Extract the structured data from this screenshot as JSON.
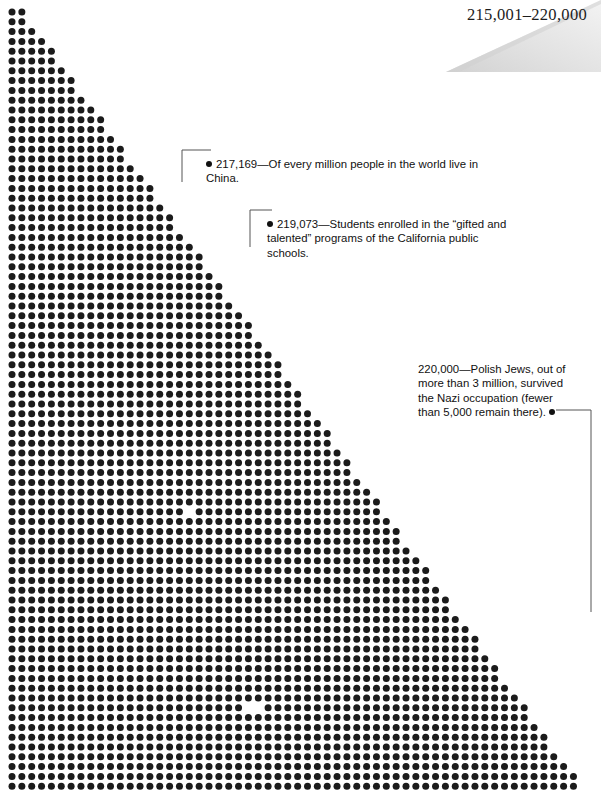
{
  "page": {
    "header_number": "215,001–220,000",
    "background_color": "#ffffff",
    "dot_color": "#1b1b1b",
    "fold_color": "#e4e4e4"
  },
  "grid": {
    "description": "right-triangle field of dots, apex top-left, filling lower-left of page",
    "dot_spacing_x": 9.85,
    "dot_spacing_y": 9.8,
    "dot_radius": 3.5,
    "origin_x": 12,
    "origin_y": 12,
    "columns": 60,
    "rows": 80,
    "hypotenuse_slope": 0.72,
    "gaps": [
      {
        "label": "gap-1",
        "x": 186,
        "y": 510
      },
      {
        "label": "gap-2",
        "x": 253,
        "y": 705
      }
    ]
  },
  "annotations": [
    {
      "id": "annotation-1",
      "value": "217,169",
      "text": "217,169—Of every million people in the world live in China.",
      "leader": {
        "dot_x": 211,
        "dot_y": 150,
        "elbow_x": 182,
        "end_y": 182
      }
    },
    {
      "id": "annotation-2",
      "value": "219,073",
      "text": "219,073—Students enrolled in the “gifted and talented” programs of the California public schools.",
      "leader": {
        "dot_x": 272,
        "dot_y": 210,
        "elbow_x": 250,
        "end_y": 247
      }
    },
    {
      "id": "annotation-3",
      "value": "220,000",
      "text": "220,000—Polish Jews, out of more than 3 million, survived the Nazi occupation (fewer than 5,000 remain there).",
      "leader": {
        "dot_x": 556,
        "dot_y": 410,
        "elbow_x": 591,
        "end_y": 612
      }
    }
  ]
}
